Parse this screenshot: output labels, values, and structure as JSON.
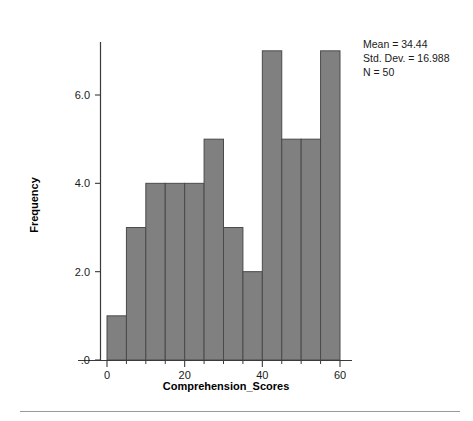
{
  "chart_data": {
    "type": "bar",
    "title": "",
    "subtitle": "",
    "xlabel": "Comprehension_Scores",
    "ylabel": "Frequency",
    "bin_width": 5,
    "bin_starts": [
      0,
      5,
      10,
      15,
      20,
      25,
      30,
      35,
      40,
      45,
      50,
      55
    ],
    "categories": [
      "0-5",
      "5-10",
      "10-15",
      "15-20",
      "20-25",
      "25-30",
      "30-35",
      "35-40",
      "40-45",
      "45-50",
      "50-55",
      "55-60"
    ],
    "values": [
      1,
      3,
      4,
      4,
      4,
      5,
      3,
      2,
      7,
      5,
      5,
      7
    ],
    "xlim": [
      -5,
      62
    ],
    "ylim": [
      0,
      7.6
    ],
    "x_ticks": [
      0,
      20,
      40,
      60
    ],
    "x_tick_labels": [
      "0",
      "20",
      "40",
      "60"
    ],
    "x_minor_ticks": [
      5,
      10,
      15,
      25,
      30,
      35,
      45,
      50,
      55
    ],
    "y_ticks": [
      0,
      2,
      4,
      6
    ],
    "y_tick_labels": [
      ".0",
      "2.0",
      "4.0",
      "6.0"
    ],
    "grid": false,
    "legend_position": "top-right",
    "bar_color": "#808080",
    "bar_edge_color": "#4a4a4a"
  },
  "statistics": {
    "mean_label": "Mean = 34.44",
    "std_dev_label": "Std. Dev. = 16.988",
    "n_label": "N = 50",
    "mean_value": 34.44,
    "std_dev_value": 16.988,
    "n_value": 50
  },
  "axes": {
    "y_axis_title": "Frequency",
    "x_axis_title": "Comprehension_Scores"
  }
}
